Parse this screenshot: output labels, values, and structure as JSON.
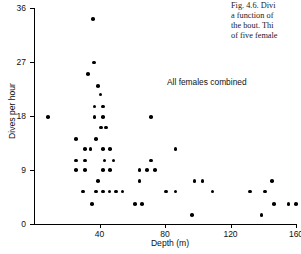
{
  "caption": {
    "lines": [
      "Fig. 4.6. Divi",
      "a function of",
      "the bout. Thi",
      "of five female"
    ]
  },
  "chart_data": {
    "type": "scatter",
    "title": "",
    "annotation": "All females combined",
    "xlabel": "Depth  (m)",
    "ylabel": "Dives per hour",
    "xlim": [
      0,
      160
    ],
    "ylim": [
      0,
      36
    ],
    "xticks": [
      40,
      80,
      120,
      160
    ],
    "yticks": [
      0,
      9,
      18,
      27,
      36
    ],
    "xtick_labels": [
      "40",
      "80",
      "120",
      "160"
    ],
    "ytick_labels": [
      "0",
      "9",
      "18",
      "27",
      "36"
    ],
    "grid": false,
    "legend": "none",
    "marker": "filled-circle",
    "marker_color": "#000000",
    "points": [
      [
        8.5,
        17.8
      ],
      [
        36.0,
        34.2
      ],
      [
        36.5,
        26.9
      ],
      [
        33.0,
        25.0
      ],
      [
        39.0,
        23.0
      ],
      [
        40.5,
        21.6
      ],
      [
        37.0,
        19.6
      ],
      [
        42.0,
        19.6
      ],
      [
        37.0,
        17.8
      ],
      [
        42.0,
        17.8
      ],
      [
        71.5,
        17.8
      ],
      [
        41.0,
        16.1
      ],
      [
        44.0,
        16.1
      ],
      [
        25.5,
        14.2
      ],
      [
        38.0,
        14.2
      ],
      [
        31.0,
        12.5
      ],
      [
        34.5,
        12.5
      ],
      [
        42.0,
        12.5
      ],
      [
        46.5,
        12.5
      ],
      [
        86.5,
        12.5
      ],
      [
        25.5,
        10.6
      ],
      [
        31.0,
        10.6
      ],
      [
        43.0,
        10.6
      ],
      [
        48.5,
        10.6
      ],
      [
        71.5,
        10.6
      ],
      [
        25.5,
        9.0
      ],
      [
        31.0,
        9.0
      ],
      [
        42.0,
        9.0
      ],
      [
        46.5,
        9.0
      ],
      [
        64.5,
        9.0
      ],
      [
        69.0,
        9.0
      ],
      [
        74.0,
        9.0
      ],
      [
        39.0,
        7.2
      ],
      [
        64.5,
        7.2
      ],
      [
        98.0,
        7.2
      ],
      [
        103.0,
        7.2
      ],
      [
        145.5,
        7.2
      ],
      [
        30.0,
        5.4
      ],
      [
        38.0,
        5.4
      ],
      [
        42.0,
        5.4
      ],
      [
        46.0,
        5.4
      ],
      [
        50.0,
        5.4
      ],
      [
        54.0,
        5.4
      ],
      [
        80.5,
        5.4
      ],
      [
        86.5,
        5.4
      ],
      [
        109.0,
        5.4
      ],
      [
        132.0,
        5.4
      ],
      [
        141.0,
        5.4
      ],
      [
        35.5,
        3.3
      ],
      [
        61.5,
        3.3
      ],
      [
        66.0,
        3.3
      ],
      [
        146.5,
        3.3
      ],
      [
        155.5,
        3.3
      ],
      [
        160.0,
        3.3
      ],
      [
        96.5,
        1.5
      ],
      [
        139.0,
        1.5
      ]
    ]
  }
}
